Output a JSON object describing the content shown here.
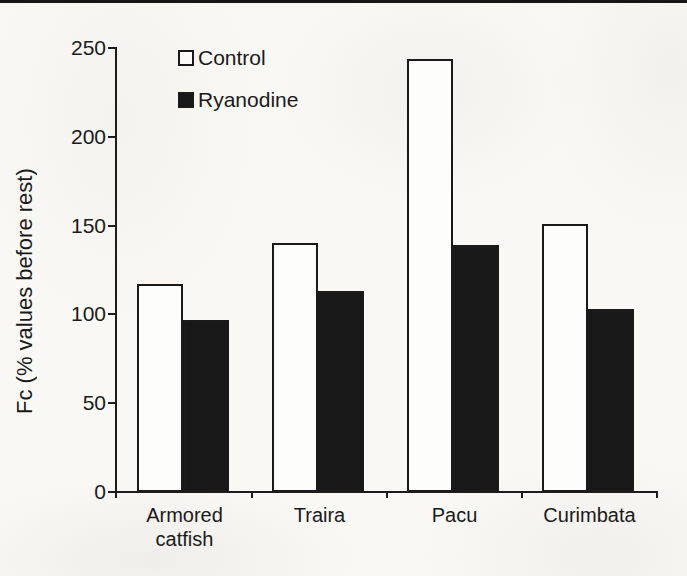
{
  "chart_data": {
    "type": "bar",
    "title": "",
    "categories": [
      "Armored catfish",
      "Traira",
      "Pacu",
      "Curimbata"
    ],
    "series": [
      {
        "name": "Control",
        "values": [
          117,
          140,
          244,
          151
        ]
      },
      {
        "name": "Ryanodine",
        "values": [
          97,
          113,
          139,
          103
        ]
      }
    ],
    "xlabel": "",
    "ylabel": "Fc (% values before rest)",
    "ylim": [
      0,
      250
    ],
    "yticks": [
      0,
      50,
      100,
      150,
      200,
      250
    ],
    "grid": false,
    "legend_position": "upper-left-inside",
    "colors": {
      "control_fill": "#fdfdfc",
      "ryanodine_fill": "#181818",
      "bar_border": "#1a1a1a",
      "axis": "#1c1c1c",
      "background": "#f9f8f5",
      "top_rule": "#161616"
    }
  }
}
